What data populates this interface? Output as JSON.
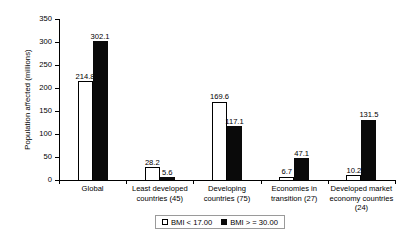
{
  "chart_data": {
    "type": "bar",
    "title": "",
    "xlabel": "",
    "ylabel": "Population affected (millions)",
    "ylim": [
      0,
      350
    ],
    "yticks": [
      0,
      50,
      100,
      150,
      200,
      250,
      300,
      350
    ],
    "ytick_labels": [
      "0",
      "50",
      "100",
      "150",
      "200",
      "250",
      "300",
      "350"
    ],
    "grid": false,
    "legend_position": "bottom-center",
    "categories": [
      "Global",
      "Least developed countries (45)",
      "Developing countries (75)",
      "Economies in transition (27)",
      "Developed market economy countries (24)"
    ],
    "category_lines": [
      [
        "Global"
      ],
      [
        "Least developed",
        "countries (45)"
      ],
      [
        "Developing",
        "countries (75)"
      ],
      [
        "Economies in",
        "transition (27)"
      ],
      [
        "Developed market",
        "economy countries (24)"
      ]
    ],
    "series": [
      {
        "name": "BMI < 17.00",
        "color": "#ffffff",
        "edge_color": "#000000",
        "values": [
          214.8,
          28.2,
          169.6,
          6.7,
          10.2
        ],
        "value_labels": [
          "214.8",
          "28.2",
          "169.6",
          "6.7",
          "10.2"
        ]
      },
      {
        "name": "BMI > = 30.00",
        "color": "#0a0a0a",
        "edge_color": "#0a0a0a",
        "values": [
          302.1,
          5.6,
          117.1,
          47.1,
          131.5
        ],
        "value_labels": [
          "302.1",
          "5.6",
          "117.1",
          "47.1",
          "131.5"
        ]
      }
    ]
  },
  "legend": {
    "items": [
      {
        "label": "BMI < 17.00"
      },
      {
        "label": "BMI > = 30.00"
      }
    ]
  }
}
